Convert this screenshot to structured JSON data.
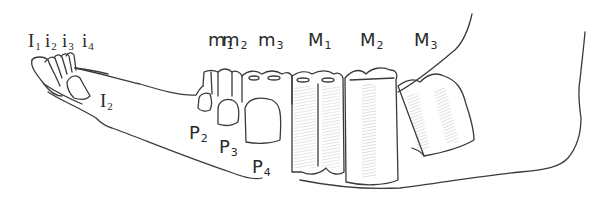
{
  "figure": {
    "stroke_color": "#3a3a3a",
    "shade_color": "#9a9a9a",
    "background": "#ffffff"
  },
  "labels": {
    "incisors": [
      {
        "base": "I",
        "sub": "1"
      },
      {
        "base": "i",
        "sub": "2"
      },
      {
        "base": "i",
        "sub": "3"
      },
      {
        "base": "i",
        "sub": "4"
      }
    ],
    "incisor_erupting": {
      "base": "I",
      "sub": "2"
    },
    "milk_molars": [
      {
        "base": "m",
        "sub": "1"
      },
      {
        "base": "m",
        "sub": "2"
      },
      {
        "base": "m",
        "sub": "3"
      }
    ],
    "molars": [
      {
        "base": "M",
        "sub": "1"
      },
      {
        "base": "M",
        "sub": "2"
      },
      {
        "base": "M",
        "sub": "3"
      }
    ],
    "premolars": [
      {
        "base": "P",
        "sub": "2"
      },
      {
        "base": "P",
        "sub": "3"
      },
      {
        "base": "P",
        "sub": "4"
      }
    ]
  }
}
